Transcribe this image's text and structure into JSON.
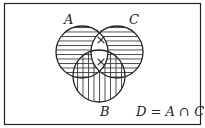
{
  "diagram": {
    "type": "venn",
    "sets": [
      {
        "name": "A",
        "label": "A",
        "hatch": "horizontal"
      },
      {
        "name": "B",
        "label": "B",
        "hatch": "vertical"
      },
      {
        "name": "C",
        "label": "C",
        "hatch": "horizontal"
      }
    ],
    "marks": [
      {
        "region": "A∩C only",
        "symbol": "×"
      },
      {
        "region": "A∩B∩C",
        "symbol": "×"
      }
    ],
    "equation": "D = A ∩ C",
    "colors": {
      "stroke": "#222222",
      "background": "#ffffff"
    }
  }
}
